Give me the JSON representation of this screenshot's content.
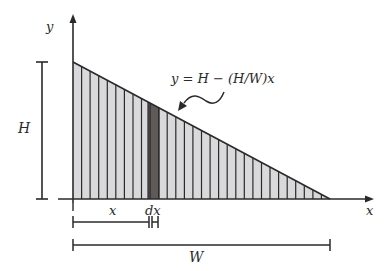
{
  "diagram": {
    "labels": {
      "y_axis": "y",
      "x_axis": "x",
      "height": "H",
      "width": "W",
      "x_dist": "x",
      "dx": "dx",
      "equation": "y = H − (H/W)x"
    },
    "geometry": {
      "origin": [
        73,
        199
      ],
      "top": [
        73,
        62
      ],
      "right": [
        330,
        199
      ],
      "strip_count": 30,
      "dark_strip": [
        148,
        159
      ]
    },
    "colors": {
      "stroke": "#2a2a2a",
      "fill_light": "#d9d9db",
      "fill_dark": "#5e5a57",
      "background": "#ffffff"
    }
  }
}
